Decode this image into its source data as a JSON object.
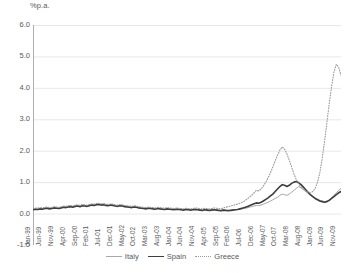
{
  "chart_data": {
    "type": "line",
    "title": "",
    "subtitle": "",
    "xlabel": "",
    "ylabel": "%p.a.",
    "unit_label": "%p.a.",
    "ylim": [
      -1.0,
      6.0
    ],
    "ytick_labels": [
      "6.0",
      "5.0",
      "4.0",
      "3.0",
      "2.0",
      "1.0",
      "0.0",
      "-1.0"
    ],
    "ytick_values": [
      6.0,
      5.0,
      4.0,
      3.0,
      2.0,
      1.0,
      0.0,
      -1.0
    ],
    "grid": true,
    "grid_axis": "y",
    "legend_position": "bottom",
    "xtick_labels": [
      "Jan-99",
      "Jun-99",
      "Nov-99",
      "Apr-00",
      "Sep-00",
      "Feb-01",
      "Jul-01",
      "Dec-01",
      "May-02",
      "Oct-02",
      "Mar-03",
      "Aug-03",
      "Jan-04",
      "Jun-04",
      "Nov-04",
      "Apr-05",
      "Sep-05",
      "Feb-06",
      "Jul-06",
      "Dec-06",
      "May-07",
      "Oct-07",
      "Mar-08",
      "Aug-08",
      "Jan-09",
      "Jun-09",
      "Nov-09"
    ],
    "xtick_step_months": 5,
    "x_start": "Jan-99",
    "x_end": "Dec-09",
    "n_points": 132,
    "series": [
      {
        "name": "Italy",
        "color": "#a8a8a8",
        "style": "solid",
        "width": 1.0,
        "values": [
          0.14,
          0.16,
          0.15,
          0.17,
          0.16,
          0.18,
          0.19,
          0.17,
          0.18,
          0.2,
          0.19,
          0.18,
          0.2,
          0.22,
          0.21,
          0.23,
          0.24,
          0.22,
          0.25,
          0.26,
          0.24,
          0.27,
          0.26,
          0.25,
          0.27,
          0.29,
          0.28,
          0.3,
          0.31,
          0.29,
          0.3,
          0.28,
          0.27,
          0.29,
          0.28,
          0.26,
          0.25,
          0.27,
          0.26,
          0.24,
          0.23,
          0.22,
          0.21,
          0.23,
          0.22,
          0.2,
          0.19,
          0.18,
          0.17,
          0.19,
          0.18,
          0.17,
          0.16,
          0.18,
          0.17,
          0.16,
          0.15,
          0.17,
          0.16,
          0.15,
          0.14,
          0.16,
          0.15,
          0.14,
          0.13,
          0.15,
          0.14,
          0.13,
          0.14,
          0.15,
          0.14,
          0.13,
          0.12,
          0.14,
          0.13,
          0.12,
          0.13,
          0.14,
          0.13,
          0.12,
          0.11,
          0.13,
          0.12,
          0.11,
          0.12,
          0.13,
          0.12,
          0.13,
          0.14,
          0.15,
          0.16,
          0.18,
          0.2,
          0.22,
          0.24,
          0.26,
          0.25,
          0.27,
          0.3,
          0.33,
          0.36,
          0.4,
          0.44,
          0.48,
          0.52,
          0.58,
          0.62,
          0.6,
          0.58,
          0.62,
          0.68,
          0.74,
          0.8,
          0.86,
          0.82,
          0.76,
          0.7,
          0.64,
          0.58,
          0.54,
          0.5,
          0.46,
          0.42,
          0.4,
          0.38,
          0.4,
          0.44,
          0.5,
          0.58,
          0.66,
          0.74,
          0.8
        ]
      },
      {
        "name": "Spain",
        "color": "#3d3d3d",
        "style": "solid",
        "width": 1.6,
        "values": [
          0.12,
          0.14,
          0.13,
          0.15,
          0.14,
          0.16,
          0.17,
          0.15,
          0.16,
          0.18,
          0.17,
          0.16,
          0.18,
          0.2,
          0.19,
          0.21,
          0.22,
          0.2,
          0.23,
          0.24,
          0.22,
          0.25,
          0.24,
          0.23,
          0.25,
          0.27,
          0.26,
          0.28,
          0.29,
          0.27,
          0.28,
          0.26,
          0.25,
          0.27,
          0.26,
          0.24,
          0.23,
          0.25,
          0.24,
          0.22,
          0.21,
          0.2,
          0.19,
          0.21,
          0.2,
          0.18,
          0.17,
          0.16,
          0.15,
          0.17,
          0.16,
          0.15,
          0.14,
          0.16,
          0.15,
          0.14,
          0.13,
          0.15,
          0.14,
          0.13,
          0.12,
          0.14,
          0.13,
          0.12,
          0.11,
          0.13,
          0.12,
          0.11,
          0.12,
          0.13,
          0.12,
          0.11,
          0.1,
          0.12,
          0.11,
          0.1,
          0.11,
          0.12,
          0.11,
          0.1,
          0.09,
          0.11,
          0.1,
          0.09,
          0.1,
          0.11,
          0.12,
          0.13,
          0.15,
          0.17,
          0.19,
          0.22,
          0.25,
          0.28,
          0.31,
          0.34,
          0.33,
          0.36,
          0.4,
          0.45,
          0.5,
          0.56,
          0.62,
          0.7,
          0.78,
          0.86,
          0.92,
          0.9,
          0.86,
          0.9,
          0.96,
          1.0,
          1.02,
          0.98,
          0.92,
          0.84,
          0.76,
          0.68,
          0.6,
          0.54,
          0.48,
          0.44,
          0.4,
          0.38,
          0.36,
          0.38,
          0.42,
          0.48,
          0.54,
          0.6,
          0.66,
          0.7
        ]
      },
      {
        "name": "Greece",
        "color": "#9a9a9a",
        "style": "dotted",
        "width": 1.1,
        "values": [
          0.16,
          0.18,
          0.17,
          0.19,
          0.18,
          0.2,
          0.21,
          0.19,
          0.2,
          0.22,
          0.21,
          0.2,
          0.22,
          0.24,
          0.23,
          0.25,
          0.26,
          0.24,
          0.27,
          0.28,
          0.26,
          0.29,
          0.28,
          0.27,
          0.29,
          0.31,
          0.3,
          0.32,
          0.33,
          0.31,
          0.32,
          0.3,
          0.29,
          0.31,
          0.3,
          0.28,
          0.27,
          0.29,
          0.28,
          0.26,
          0.25,
          0.24,
          0.23,
          0.25,
          0.24,
          0.22,
          0.21,
          0.2,
          0.19,
          0.21,
          0.2,
          0.19,
          0.18,
          0.2,
          0.19,
          0.18,
          0.17,
          0.19,
          0.18,
          0.17,
          0.16,
          0.18,
          0.17,
          0.16,
          0.15,
          0.17,
          0.16,
          0.15,
          0.16,
          0.18,
          0.17,
          0.16,
          0.15,
          0.17,
          0.16,
          0.15,
          0.16,
          0.18,
          0.17,
          0.16,
          0.15,
          0.18,
          0.2,
          0.22,
          0.24,
          0.26,
          0.28,
          0.3,
          0.33,
          0.36,
          0.4,
          0.46,
          0.52,
          0.58,
          0.66,
          0.74,
          0.72,
          0.78,
          0.88,
          1.0,
          1.14,
          1.3,
          1.48,
          1.68,
          1.86,
          2.02,
          2.12,
          2.05,
          1.9,
          1.7,
          1.48,
          1.26,
          1.08,
          0.94,
          0.84,
          0.78,
          0.72,
          0.68,
          0.66,
          0.7,
          0.8,
          1.0,
          1.3,
          1.75,
          2.3,
          2.9,
          3.5,
          4.05,
          4.5,
          4.75,
          4.65,
          4.4
        ]
      }
    ]
  },
  "legend": {
    "items": [
      {
        "label": "Italy"
      },
      {
        "label": "Spain"
      },
      {
        "label": "Greece"
      }
    ]
  }
}
